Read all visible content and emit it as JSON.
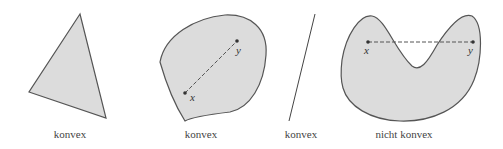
{
  "figures": [
    {
      "id": "triangle",
      "label": "konvex"
    },
    {
      "id": "rounded-blob",
      "label": "konvex",
      "points": {
        "x": "x",
        "y": "y"
      }
    },
    {
      "id": "line-segment",
      "label": "konvex"
    },
    {
      "id": "kidney-blob",
      "label": "nicht konvex",
      "points": {
        "x": "x",
        "y": "y"
      }
    }
  ],
  "colors": {
    "fill": "#dcdcdc",
    "stroke": "#555555"
  }
}
